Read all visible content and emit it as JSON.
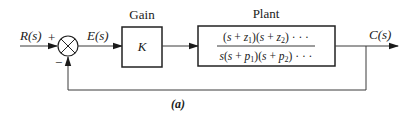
{
  "diagram": {
    "type": "feedback-control-block-diagram",
    "caption": "(a)",
    "input_label": "R(s)",
    "error_label": "E(s)",
    "output_label": "C(s)",
    "summing_junction": {
      "plus_sign": "+",
      "minus_sign": "−"
    },
    "gain_block": {
      "title": "Gain",
      "content": "K"
    },
    "plant_block": {
      "title": "Plant",
      "numerator": "(s + z1)(s + z2) · · ·",
      "denominator": "s(s + p1)(s + p2) · · ·"
    },
    "colors": {
      "line": "#3a3a3a",
      "text": "#1a1a1a",
      "background": "#ffffff"
    }
  }
}
